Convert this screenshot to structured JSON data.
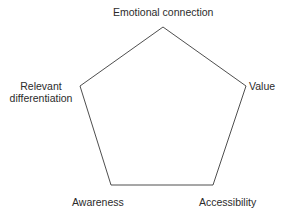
{
  "diagram": {
    "type": "pentagon",
    "nodes": [
      {
        "id": "emotional-connection",
        "label": "Emotional connection",
        "position": "top"
      },
      {
        "id": "value",
        "label": "Value",
        "position": "right"
      },
      {
        "id": "accessibility",
        "label": "Accessibility",
        "position": "bottom-right"
      },
      {
        "id": "awareness",
        "label": "Awareness",
        "position": "bottom-left"
      },
      {
        "id": "relevant-differentiation",
        "label": "Relevant differentiation",
        "label_lines": [
          "Relevant",
          "differentiation"
        ],
        "position": "left"
      }
    ],
    "edges": [
      [
        "emotional-connection",
        "value"
      ],
      [
        "value",
        "accessibility"
      ],
      [
        "accessibility",
        "awareness"
      ],
      [
        "awareness",
        "relevant-differentiation"
      ],
      [
        "relevant-differentiation",
        "emotional-connection"
      ]
    ],
    "colors": {
      "stroke": "#3a3a3a",
      "text": "#2b2b2b",
      "background": "#ffffff"
    }
  }
}
